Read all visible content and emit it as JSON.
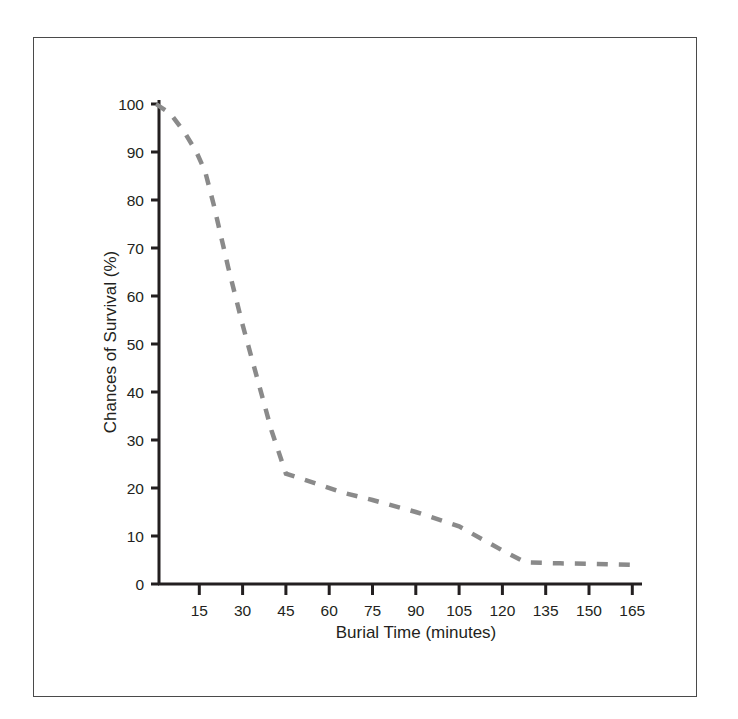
{
  "figure": {
    "frame_color": "#4a4a4a",
    "background": "#ffffff"
  },
  "chart_data": {
    "type": "line",
    "title": "",
    "subtitle": "",
    "xlabel": "Burial Time (minutes)",
    "ylabel": "Chances of Survival (%)",
    "xlim": [
      0,
      172
    ],
    "ylim": [
      0,
      100
    ],
    "grid": false,
    "legend": null,
    "legend_position": "none",
    "line_style": "dashed",
    "line_color": "#8a8a8a",
    "line_width": 4.5,
    "xticks": [
      15,
      30,
      45,
      60,
      75,
      90,
      105,
      120,
      135,
      150,
      165
    ],
    "xtick_labels": [
      "15",
      "30",
      "45",
      "60",
      "75",
      "90",
      "105",
      "120",
      "135",
      "150",
      "165"
    ],
    "yticks": [
      0,
      10,
      20,
      30,
      40,
      50,
      60,
      70,
      80,
      90,
      100
    ],
    "ytick_labels": [
      "0",
      "10",
      "20",
      "30",
      "40",
      "50",
      "60",
      "70",
      "80",
      "90",
      "100"
    ],
    "series": [
      {
        "name": "Chances of Survival",
        "x": [
          0,
          5,
          10,
          14,
          17,
          20,
          25,
          30,
          35,
          40,
          45,
          55,
          65,
          75,
          90,
          105,
          120,
          128,
          140,
          152,
          165
        ],
        "values": [
          100,
          98,
          94,
          90,
          86,
          79,
          66,
          54,
          43,
          32,
          23,
          21,
          19,
          17.5,
          15,
          12,
          7,
          4.5,
          4.3,
          4.2,
          4
        ]
      }
    ],
    "annotations": []
  }
}
